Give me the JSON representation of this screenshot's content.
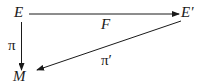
{
  "diagram": {
    "type": "commutative-diagram",
    "nodes": {
      "E": "E",
      "E_prime": "E′",
      "M": "M"
    },
    "edges": [
      {
        "from": "E",
        "to": "E′",
        "label": "F"
      },
      {
        "from": "E",
        "to": "M",
        "label": "π"
      },
      {
        "from": "E′",
        "to": "M",
        "label": "π′"
      }
    ],
    "labels": {
      "F": "F",
      "pi": "π",
      "pi_prime": "π′"
    },
    "colors": {
      "stroke": "#1a1a1a",
      "background": "#ffffff"
    }
  }
}
